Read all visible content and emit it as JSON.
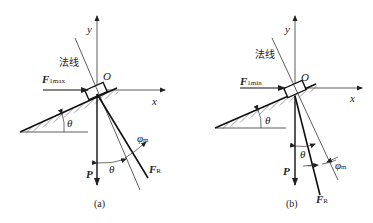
{
  "figures": [
    {
      "id": "a",
      "caption": "(a)",
      "labels": {
        "y_axis": "y",
        "x_axis": "x",
        "origin": "O",
        "normal_line": "法线",
        "force_applied": "F",
        "force_applied_sub": "1max",
        "weight": "P",
        "resultant": "F",
        "resultant_sub": "R",
        "incline_angle": "θ",
        "angle_between_P_and_normal": "θ",
        "friction_angle": "φ",
        "friction_angle_sub": "m"
      }
    },
    {
      "id": "b",
      "caption": "(b)",
      "labels": {
        "y_axis": "y",
        "x_axis": "x",
        "origin": "O",
        "normal_line": "法线",
        "force_applied": "F",
        "force_applied_sub": "1min",
        "weight": "P",
        "resultant": "F",
        "resultant_sub": "R",
        "incline_angle": "θ",
        "angle_between_P_and_normal": "θ",
        "friction_angle": "φ",
        "friction_angle_sub": "m"
      }
    }
  ]
}
